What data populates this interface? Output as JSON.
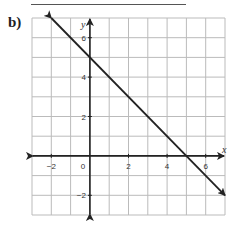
{
  "part_label": "b)",
  "chart_data": {
    "type": "line",
    "title": "",
    "xlabel": "x",
    "ylabel": "y",
    "xlim": [
      -3,
      7
    ],
    "ylim": [
      -3,
      7
    ],
    "grid": true,
    "x_tick_labels": [
      "-2",
      "0",
      "2",
      "4",
      "6"
    ],
    "y_tick_labels": [
      "6",
      "4",
      "2",
      "-2"
    ],
    "series": [
      {
        "name": "line",
        "equation": "y = 5 - x",
        "slope": -1,
        "y_intercept": 5,
        "x_intercept": 5,
        "x": [
          -2,
          7
        ],
        "y": [
          7,
          -2
        ],
        "arrows": "both ends"
      }
    ],
    "colors": {
      "line": "#222222",
      "grid": "#bbbbbb",
      "axis": "#222222"
    }
  }
}
